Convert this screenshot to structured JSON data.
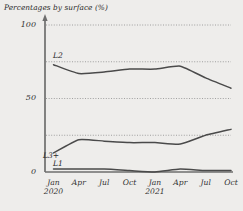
{
  "chart_data": {
    "type": "line",
    "title": "Percentages by surface (%)",
    "xlabel": "",
    "ylabel": "",
    "ylim": [
      0,
      100
    ],
    "ytick_labels": [
      "0",
      "50",
      "100"
    ],
    "ytick_values": [
      0,
      50,
      100
    ],
    "gridlines": [
      25,
      50,
      75,
      100
    ],
    "grid": true,
    "grid_style": "dotted",
    "legend_position": "inline-left",
    "x": [
      "Jan 2020",
      "Apr 2020",
      "Jul 2020",
      "Oct 2020",
      "Jan 2021",
      "Apr 2021",
      "Jul 2021",
      "Oct 2021"
    ],
    "xtick_labels": [
      {
        "label": "Jan",
        "sub": "2020"
      },
      {
        "label": "Apr",
        "sub": ""
      },
      {
        "label": "Jul",
        "sub": ""
      },
      {
        "label": "Oct",
        "sub": ""
      },
      {
        "label": "Jan",
        "sub": "2021"
      },
      {
        "label": "Apr",
        "sub": ""
      },
      {
        "label": "Jul",
        "sub": ""
      },
      {
        "label": "Oct",
        "sub": ""
      }
    ],
    "series": [
      {
        "name": "L2",
        "label": "L2",
        "color": "#4a4a4a",
        "values": [
          73,
          67,
          68,
          70,
          70,
          72,
          64,
          57
        ]
      },
      {
        "name": "L3+",
        "label": "L3+",
        "color": "#4a4a4a",
        "values": [
          13,
          22,
          21,
          20,
          20,
          19,
          25,
          29
        ]
      },
      {
        "name": "L1",
        "label": "L1",
        "color": "#4a4a4a",
        "values": [
          2,
          2,
          2,
          1,
          0,
          2,
          1,
          1
        ]
      }
    ],
    "axis_color": "#6e6e6e",
    "grid_color": "#8c8c8c",
    "background": "#eeedeb"
  }
}
